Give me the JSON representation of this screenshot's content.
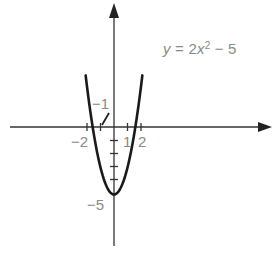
{
  "chart_data": {
    "type": "line",
    "title": "",
    "equation": "y = 2x² − 5",
    "equation_parts": {
      "lhs": "y",
      "eq": " = 2",
      "var": "x",
      "exp": "2",
      "rest": " − 5"
    },
    "series": [
      {
        "name": "y = 2x² − 5",
        "x": [
          -2.1,
          -2,
          -1.5,
          -1,
          -0.5,
          0,
          0.5,
          1,
          1.5,
          2,
          2.1
        ],
        "y": [
          3.82,
          3,
          -0.5,
          -3,
          -4.5,
          -5,
          -4.5,
          -3,
          -0.5,
          3,
          3.82
        ]
      }
    ],
    "xlabel": "",
    "ylabel": "",
    "x_ticks": [
      -2,
      -1,
      1,
      2
    ],
    "y_ticks": [
      -1,
      -2,
      -3,
      -4,
      -5
    ],
    "tick_labels": {
      "x_neg2": "−2",
      "x_1": "1",
      "x_2": "2",
      "y_neg1": "−1",
      "y_neg5": "−5"
    },
    "xlim": [
      -7.5,
      11.5
    ],
    "ylim": [
      -8.8,
      9
    ],
    "grid": false,
    "legend": "none",
    "colors": {
      "curve": "#1a1a1a",
      "axes": "#333333",
      "text": "#8a8a8a"
    }
  }
}
